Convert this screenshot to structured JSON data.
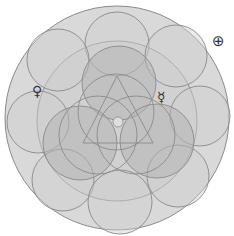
{
  "diagram": {
    "colors": {
      "background": "#ffffff",
      "outer_fill": "#d9d9d9",
      "stroke": "#8a8a8a",
      "ring_fill": "#cfcfcf",
      "inner_fill": "#c4c4c4",
      "dark_fill": "#b5b5b5",
      "symbol": "#333333"
    },
    "outer_circle": {
      "cx": 117,
      "cy": 118,
      "r": 112
    },
    "large_inner_circle": {
      "cx": 117,
      "cy": 121,
      "r": 80
    },
    "ring_circles": [
      {
        "cx": 117,
        "cy": 44,
        "r": 32
      },
      {
        "cx": 58,
        "cy": 60,
        "r": 31
      },
      {
        "cx": 176,
        "cy": 56,
        "r": 31
      },
      {
        "cx": 38,
        "cy": 122,
        "r": 31
      },
      {
        "cx": 200,
        "cy": 116,
        "r": 30
      },
      {
        "cx": 63,
        "cy": 180,
        "r": 31
      },
      {
        "cx": 178,
        "cy": 176,
        "r": 31
      },
      {
        "cx": 120,
        "cy": 202,
        "r": 32
      }
    ],
    "triad_circles": [
      {
        "cx": 119,
        "cy": 83,
        "r": 37
      },
      {
        "cx": 80,
        "cy": 143,
        "r": 37
      },
      {
        "cx": 157,
        "cy": 141,
        "r": 37
      }
    ],
    "center_circles": [
      {
        "cx": 116,
        "cy": 112,
        "r": 38
      },
      {
        "cx": 98,
        "cy": 135,
        "r": 39
      },
      {
        "cx": 136,
        "cy": 135,
        "r": 39
      }
    ],
    "triangle": {
      "points": "117,76 83,143 153,143"
    },
    "center_dot": {
      "cx": 118,
      "cy": 122,
      "r": 5
    },
    "symbols": [
      {
        "name": "venus",
        "glyph": "♀",
        "x": 32,
        "y": 84,
        "size": 14
      },
      {
        "name": "mercury",
        "glyph": "☿",
        "x": 157,
        "y": 90,
        "size": 14
      },
      {
        "name": "earth",
        "glyph": "⊕",
        "x": 212,
        "y": 34,
        "size": 15
      }
    ]
  }
}
